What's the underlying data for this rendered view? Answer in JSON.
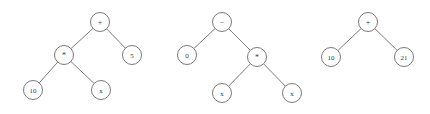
{
  "figure": {
    "background_color": "#ffffff",
    "node_fill": "#ffffff",
    "node_stroke": "#6b6b6b",
    "edge_color": "#6e6e6e",
    "label_color": "#3a3a3a",
    "node_radius": 9.5,
    "trees": [
      {
        "name": "expression-tree-1",
        "expression": "10 * x + 5",
        "nodes": [
          {
            "id": "t1-root",
            "label": "+",
            "kind": "operator",
            "cx": 100,
            "cy": 22
          },
          {
            "id": "t1-mul",
            "label": "*",
            "kind": "operator",
            "cx": 64,
            "cy": 55
          },
          {
            "id": "t1-ten",
            "label": "10",
            "kind": "operand",
            "cx": 33,
            "cy": 90
          },
          {
            "id": "t1-x",
            "label": "x",
            "kind": "operand",
            "cx": 101,
            "cy": 90
          },
          {
            "id": "t1-five",
            "label": "5",
            "kind": "operand",
            "cx": 132,
            "cy": 55
          }
        ],
        "edges": [
          {
            "from": "t1-root",
            "to": "t1-mul"
          },
          {
            "from": "t1-root",
            "to": "t1-five"
          },
          {
            "from": "t1-mul",
            "to": "t1-ten"
          },
          {
            "from": "t1-mul",
            "to": "t1-x"
          }
        ]
      },
      {
        "name": "expression-tree-2",
        "expression": "0 - x * x",
        "nodes": [
          {
            "id": "t2-root",
            "label": "−",
            "kind": "operator",
            "cx": 222,
            "cy": 22
          },
          {
            "id": "t2-zero",
            "label": "0",
            "kind": "operand",
            "cx": 187,
            "cy": 55
          },
          {
            "id": "t2-mul",
            "label": "*",
            "kind": "operator",
            "cx": 257,
            "cy": 57
          },
          {
            "id": "t2-x1",
            "label": "x",
            "kind": "operand",
            "cx": 222,
            "cy": 93
          },
          {
            "id": "t2-x2",
            "label": "x",
            "kind": "operand",
            "cx": 292,
            "cy": 93
          }
        ],
        "edges": [
          {
            "from": "t2-root",
            "to": "t2-zero"
          },
          {
            "from": "t2-root",
            "to": "t2-mul"
          },
          {
            "from": "t2-mul",
            "to": "t2-x1"
          },
          {
            "from": "t2-mul",
            "to": "t2-x2"
          }
        ]
      },
      {
        "name": "expression-tree-3",
        "expression": "10 + 21",
        "nodes": [
          {
            "id": "t3-root",
            "label": "+",
            "kind": "operator",
            "cx": 368,
            "cy": 22
          },
          {
            "id": "t3-ten",
            "label": "10",
            "kind": "operand",
            "cx": 331,
            "cy": 57
          },
          {
            "id": "t3-two1",
            "label": "21",
            "kind": "operand",
            "cx": 404,
            "cy": 57
          }
        ],
        "edges": [
          {
            "from": "t3-root",
            "to": "t3-ten"
          },
          {
            "from": "t3-root",
            "to": "t3-two1"
          }
        ]
      }
    ]
  }
}
